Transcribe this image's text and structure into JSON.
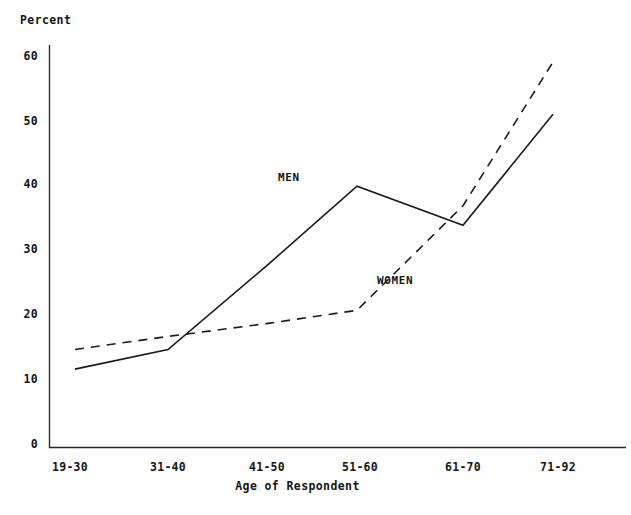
{
  "chart_data": {
    "type": "line",
    "title": "",
    "ylabel": "Percent",
    "xlabel": "Age of Respondent",
    "categories": [
      "19-30",
      "31-40",
      "41-50",
      "51-60",
      "61-70",
      "71-92"
    ],
    "ylim": [
      0,
      60
    ],
    "yticks": [
      0,
      10,
      20,
      30,
      40,
      50,
      60
    ],
    "ytick_labels": [
      "0",
      "10",
      "20",
      "30",
      "40",
      "50",
      "60"
    ],
    "grid": false,
    "legend_position": "inline-annotation",
    "series": [
      {
        "name": "MEN",
        "style": "solid",
        "color": "#1a1a1a",
        "values": [
          12,
          15,
          28,
          40,
          34,
          51
        ]
      },
      {
        "name": "WOMEN",
        "style": "dashed",
        "color": "#1a1a1a",
        "values": [
          15,
          17,
          19,
          21,
          37,
          59
        ]
      }
    ],
    "annotations": [
      {
        "text": "MEN",
        "x_px": 278,
        "y_px": 171
      },
      {
        "text": "WOMEN",
        "x_px": 377,
        "y_px": 274
      }
    ]
  },
  "axes": {
    "y_axis_label": "Percent",
    "x_axis_label": "Age of Respondent"
  }
}
